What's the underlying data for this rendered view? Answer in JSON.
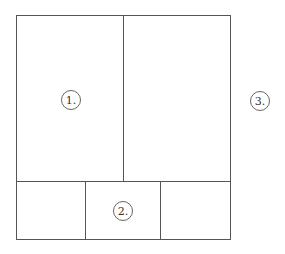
{
  "diagram": {
    "frame": {
      "x": 16,
      "y": 15,
      "width": 215,
      "height": 225
    },
    "line_color": "#555555",
    "regions": [
      {
        "label": "1.",
        "cx": 71,
        "cy": 100
      },
      {
        "label": "2.",
        "cx": 123,
        "cy": 211
      },
      {
        "label": "3.",
        "cx": 260,
        "cy": 101
      }
    ]
  }
}
